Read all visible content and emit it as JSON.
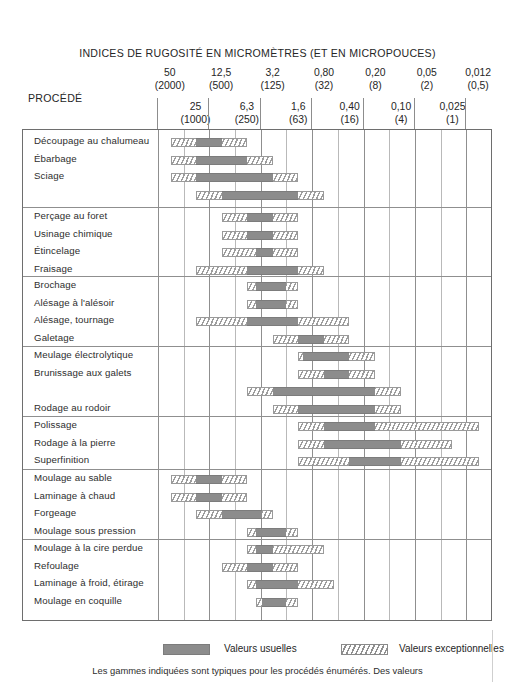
{
  "header": {
    "title": "INDICES DE RUGOSITÉ EN MICROMÈTRES (ET EN MICROPOUCES)",
    "procede_label": "PROCÉDÉ"
  },
  "legend": {
    "usual_label": "Valeurs usuelles",
    "exceptional_label": "Valeurs exceptionnelles",
    "usual_swatch": "solid-gray-swatch",
    "exceptional_swatch": "hatched-swatch"
  },
  "footnote": "Les gammes indiquées sont typiques pour les procédés énumérés. Des valeurs",
  "colors": {
    "usual": "#8c8c8c",
    "exceptional_line": "#9a9a9a",
    "frame": "#6e6e6e",
    "grid": "#b9b9b9",
    "text": "#2b2b2b"
  },
  "chart_data": {
    "type": "bar",
    "title": "INDICES DE RUGOSITÉ EN MICROMÈTRES (ET EN MICROPOUCES)",
    "xlabel": "Rugosité (µm / µpouces)",
    "ylabel": "PROCÉDÉ",
    "grid": true,
    "legend_position": "bottom",
    "axis_note": "Échelle logarithmique décroissante de gauche à droite; 13 colonnes de 50 µm à 0,012 µm",
    "axis_upper_ticks": [
      {
        "um": "50",
        "uin": "(2000)"
      },
      {
        "um": "12,5",
        "uin": "(500)"
      },
      {
        "um": "3,2",
        "uin": "(125)"
      },
      {
        "um": "0,80",
        "uin": "(32)"
      },
      {
        "um": "0,20",
        "uin": "(8)"
      },
      {
        "um": "0,05",
        "uin": "(2)"
      },
      {
        "um": "0,012",
        "uin": "(0,5)"
      }
    ],
    "axis_lower_ticks": [
      {
        "um": "25",
        "uin": "(1000)"
      },
      {
        "um": "6,3",
        "uin": "(250)"
      },
      {
        "um": "1,6",
        "uin": "(63)"
      },
      {
        "um": "0,40",
        "uin": "(16)"
      },
      {
        "um": "0,10",
        "uin": "(4)"
      },
      {
        "um": "0,025",
        "uin": "(1)"
      }
    ],
    "column_values": [
      "50",
      "25",
      "12,5",
      "6,3",
      "3,2",
      "1,6",
      "0,80",
      "0,40",
      "0,20",
      "0,10",
      "0,05",
      "0,025",
      "0,012"
    ],
    "series": [
      {
        "name": "Valeurs usuelles",
        "color": "#8c8c8c",
        "fill": "solid"
      },
      {
        "name": "Valeurs exceptionnelles",
        "color": "#ffffff",
        "fill": "hatched"
      }
    ],
    "groups": [
      {
        "group": 1,
        "rows": [
          {
            "label": "Découpage au chalumeau",
            "exceptional": [
              50,
              6.3
            ],
            "usual": [
              25,
              12.5
            ]
          },
          {
            "label": "Ébarbage",
            "exceptional": [
              50,
              3.2
            ],
            "usual": [
              25,
              6.3
            ]
          },
          {
            "label": "Sciage",
            "exceptional": [
              50,
              1.6
            ],
            "usual": [
              25,
              3.2
            ]
          },
          {
            "label": "",
            "exceptional": [
              25,
              0.8
            ],
            "usual": [
              12.5,
              1.6
            ]
          }
        ]
      },
      {
        "group": 2,
        "rows": [
          {
            "label": "Perçage au foret",
            "exceptional": [
              12.5,
              1.6
            ],
            "usual": [
              6.3,
              3.2
            ]
          },
          {
            "label": "Usinage chimique",
            "exceptional": [
              12.5,
              1.6
            ],
            "usual": [
              6.3,
              3.2
            ]
          },
          {
            "label": "Étincelage",
            "exceptional": [
              12.5,
              1.6
            ],
            "usual": [
              5.0,
              3.2
            ]
          },
          {
            "label": "Fraisage",
            "exceptional": [
              25,
              0.8
            ],
            "usual": [
              6.3,
              1.6
            ]
          }
        ]
      },
      {
        "group": 3,
        "rows": [
          {
            "label": "Brochage",
            "exceptional": [
              6.3,
              1.6
            ],
            "usual": [
              5.0,
              2.2
            ]
          },
          {
            "label": "Alésage à l'alésoir",
            "exceptional": [
              6.3,
              1.6
            ],
            "usual": [
              5.0,
              2.2
            ]
          },
          {
            "label": "Alésage, tournage",
            "exceptional": [
              25,
              0.4
            ],
            "usual": [
              6.3,
              1.6
            ]
          },
          {
            "label": "Galetage",
            "exceptional": [
              3.2,
              0.4
            ],
            "usual": [
              1.6,
              0.8
            ]
          }
        ]
      },
      {
        "group": 4,
        "rows": [
          {
            "label": "Meulage électrolytique",
            "exceptional": [
              1.6,
              0.2
            ],
            "usual": [
              1.4,
              0.4
            ]
          },
          {
            "label": "Brunissage aux galets",
            "exceptional": [
              1.6,
              0.2
            ],
            "usual": [
              0.8,
              0.4
            ]
          },
          {
            "label": "",
            "exceptional": [
              6.3,
              0.1
            ],
            "usual": [
              3.2,
              0.2
            ]
          },
          {
            "label": "Rodage au rodoir",
            "exceptional": [
              3.2,
              0.1
            ],
            "usual": [
              1.6,
              0.2
            ]
          }
        ]
      },
      {
        "group": 5,
        "rows": [
          {
            "label": "Polissage",
            "exceptional": [
              1.6,
              0.012
            ],
            "usual": [
              0.8,
              0.2
            ]
          },
          {
            "label": "Rodage à la pierre",
            "exceptional": [
              1.6,
              0.025
            ],
            "usual": [
              0.8,
              0.1
            ]
          },
          {
            "label": "Superfinition",
            "exceptional": [
              1.6,
              0.012
            ],
            "usual": [
              0.4,
              0.1
            ]
          }
        ]
      },
      {
        "group": 6,
        "rows": [
          {
            "label": "Moulage au sable",
            "exceptional": [
              50,
              6.3
            ],
            "usual": [
              25,
              12.5
            ]
          },
          {
            "label": "Laminage à chaud",
            "exceptional": [
              50,
              6.3
            ],
            "usual": [
              25,
              12.5
            ]
          },
          {
            "label": "Forgeage",
            "exceptional": [
              25,
              3.2
            ],
            "usual": [
              12.5,
              4.2
            ]
          },
          {
            "label": "Moulage sous pression",
            "exceptional": [
              6.3,
              1.6
            ],
            "usual": [
              5.0,
              2.2
            ]
          }
        ]
      },
      {
        "group": 7,
        "rows": [
          {
            "label": "Moulage à la cire perdue",
            "exceptional": [
              6.3,
              0.8
            ],
            "usual": [
              5.0,
              3.2
            ]
          },
          {
            "label": "Refoulage",
            "exceptional": [
              12.5,
              1.6
            ],
            "usual": [
              6.3,
              3.2
            ]
          },
          {
            "label": "Laminage à froid, étirage",
            "exceptional": [
              6.3,
              0.6
            ],
            "usual": [
              5.0,
              1.6
            ]
          },
          {
            "label": "Moulage en coquille",
            "exceptional": [
              5.0,
              1.6
            ],
            "usual": [
              4.2,
              2.2
            ]
          }
        ]
      }
    ]
  }
}
